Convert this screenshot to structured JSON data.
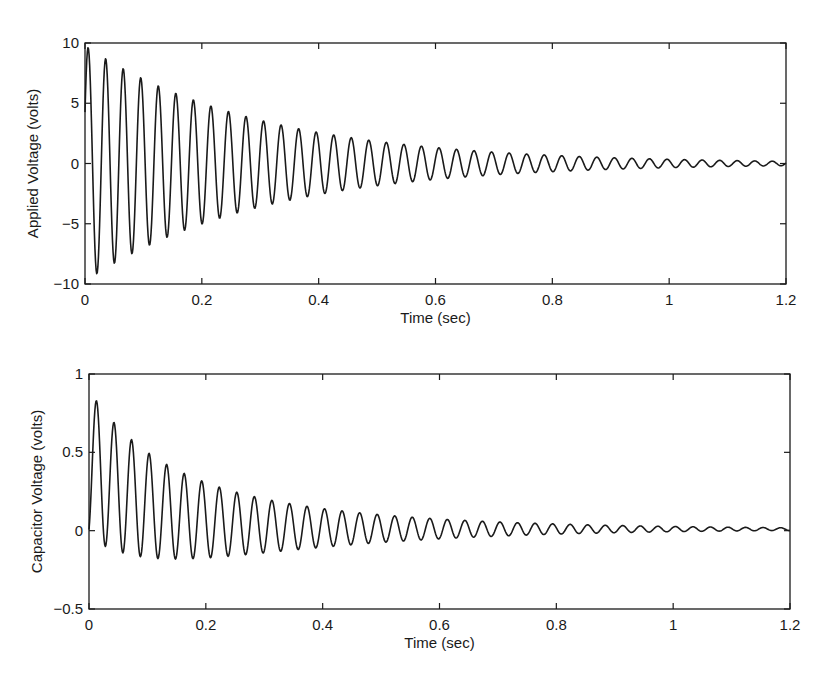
{
  "figure": {
    "panels": 2,
    "layout": "vertical-stack"
  },
  "chart_data": [
    {
      "type": "line",
      "title": "",
      "xlabel": "Time (sec)",
      "ylabel": "Applied Voltage (volts)",
      "xlim": [
        0,
        1.2
      ],
      "ylim": [
        -10,
        10
      ],
      "xticks": [
        0,
        0.2,
        0.4,
        0.6,
        0.8,
        1,
        1.2
      ],
      "xtick_labels": [
        "0",
        "0.2",
        "0.4",
        "0.6",
        "0.8",
        "1",
        "1.2"
      ],
      "yticks": [
        -10,
        -5,
        0,
        5,
        10
      ],
      "ytick_labels": [
        "−10",
        "−5",
        "0",
        "5",
        "10"
      ],
      "grid": false,
      "legend": null,
      "box": {
        "left": 85,
        "top": 43,
        "right": 786,
        "bottom": 284
      },
      "observed_values": {
        "description": "Approximate readings taken from the rendered figure",
        "first_peak": {
          "t": 0.004,
          "v": 9.6
        },
        "first_trough": {
          "t": 0.02,
          "v": -8.7
        },
        "peak_near_0.2s": 4.4,
        "amplitude_near_0.6s": 1.3,
        "amplitude_near_1.2s": 0.25,
        "oscillation_period_s": 0.03
      },
      "approximation_model": {
        "note": "Analytic curve fitted by eye to the observed values above; used only to draw the line, not recovered from the original data.",
        "formula": "v = amp * exp(-t/tau) * sin(2*pi*freq*t + phase)",
        "amp": 9.8,
        "tau": 0.3,
        "freq_hz": 33.3,
        "phase_rad": 0.45,
        "sample_step_s": 0.001
      },
      "series": [
        {
          "name": "Applied Voltage",
          "color": "#1a1a1a"
        }
      ]
    },
    {
      "type": "line",
      "title": "",
      "xlabel": "Time (sec)",
      "ylabel": "Capacitor Voltage (volts)",
      "xlim": [
        0,
        1.2
      ],
      "ylim": [
        -0.5,
        1
      ],
      "xticks": [
        0,
        0.2,
        0.4,
        0.6,
        0.8,
        1,
        1.2
      ],
      "xtick_labels": [
        "0",
        "0.2",
        "0.4",
        "0.6",
        "0.8",
        "1",
        "1.2"
      ],
      "yticks": [
        -0.5,
        0,
        0.5,
        1
      ],
      "ytick_labels": [
        "−0.5",
        "0",
        "0.5",
        "1"
      ],
      "grid": false,
      "legend": null,
      "box": {
        "left": 89,
        "top": 374,
        "right": 790,
        "bottom": 609
      },
      "observed_values": {
        "description": "Approximate readings taken from the rendered figure",
        "peaks": [
          0.86,
          0.71,
          0.59,
          0.5,
          0.42,
          0.36,
          0.31,
          0.27,
          0.24,
          0.21,
          0.19
        ],
        "troughs": [
          -0.08,
          -0.13,
          -0.15,
          -0.17,
          -0.17,
          -0.17
        ],
        "amplitude_near_0.34s": 0.13,
        "amplitude_near_0.6s": 0.06,
        "oscillation_period_s": 0.03
      },
      "approximation_model": {
        "note": "Analytic curve fitted by eye to the observed values above; used only to draw the line, not recovered from the original data.",
        "formula": "v = m0*exp(-t/tau_m) + a0*exp(-t/tau_a)*sin(2*pi*freq*t + phase) + offset",
        "m0": 0.42,
        "tau_m": 0.1,
        "a0": 0.47,
        "tau_a": 0.3,
        "freq_hz": 33.3,
        "phase_rad": -1.12,
        "offset": 0.01,
        "sample_step_s": 0.001
      },
      "series": [
        {
          "name": "Capacitor Voltage",
          "color": "#1a1a1a"
        }
      ]
    }
  ]
}
